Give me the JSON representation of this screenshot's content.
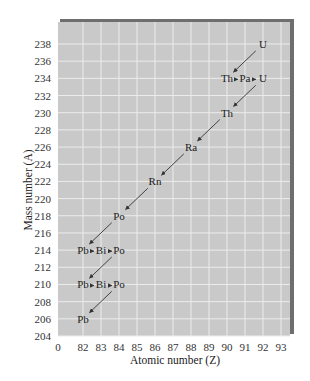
{
  "chart_data": {
    "type": "scatter",
    "title": "",
    "xlabel": "Atomic number (Z)",
    "ylabel": "Mass number (A)",
    "x_ticks": [
      "0",
      "82",
      "83",
      "84",
      "85",
      "86",
      "87",
      "88",
      "89",
      "90",
      "91",
      "92",
      "93"
    ],
    "y_ticks": [
      "238",
      "236",
      "234",
      "232",
      "230",
      "228",
      "226",
      "224",
      "222",
      "220",
      "218",
      "216",
      "214",
      "212",
      "210",
      "208",
      "206",
      "204"
    ],
    "xlim": [
      81,
      93.5
    ],
    "ylim": [
      204,
      240
    ],
    "grid": true,
    "nuclides": [
      {
        "symbol": "U",
        "Z": 92,
        "A": 238
      },
      {
        "symbol": "Th",
        "Z": 90,
        "A": 234
      },
      {
        "symbol": "Pa",
        "Z": 91,
        "A": 234
      },
      {
        "symbol": "U",
        "Z": 92,
        "A": 234
      },
      {
        "symbol": "Th",
        "Z": 90,
        "A": 230
      },
      {
        "symbol": "Ra",
        "Z": 88,
        "A": 226
      },
      {
        "symbol": "Rn",
        "Z": 86,
        "A": 222
      },
      {
        "symbol": "Po",
        "Z": 84,
        "A": 218
      },
      {
        "symbol": "Pb",
        "Z": 82,
        "A": 214
      },
      {
        "symbol": "Bi",
        "Z": 83,
        "A": 214
      },
      {
        "symbol": "Po",
        "Z": 84,
        "A": 214
      },
      {
        "symbol": "Pb",
        "Z": 82,
        "A": 210
      },
      {
        "symbol": "Bi",
        "Z": 83,
        "A": 210
      },
      {
        "symbol": "Po",
        "Z": 84,
        "A": 210
      },
      {
        "symbol": "Pb",
        "Z": 82,
        "A": 206
      }
    ],
    "alpha_decays": [
      {
        "from": [
          92,
          238
        ],
        "to": [
          90,
          234
        ]
      },
      {
        "from": [
          92,
          234
        ],
        "to": [
          90,
          230
        ]
      },
      {
        "from": [
          90,
          230
        ],
        "to": [
          88,
          226
        ]
      },
      {
        "from": [
          88,
          226
        ],
        "to": [
          86,
          222
        ]
      },
      {
        "from": [
          86,
          222
        ],
        "to": [
          84,
          218
        ]
      },
      {
        "from": [
          84,
          218
        ],
        "to": [
          82,
          214
        ]
      },
      {
        "from": [
          84,
          214
        ],
        "to": [
          82,
          210
        ]
      },
      {
        "from": [
          84,
          210
        ],
        "to": [
          82,
          206
        ]
      }
    ],
    "beta_decays": [
      {
        "from": [
          90,
          234
        ],
        "to": [
          91,
          234
        ]
      },
      {
        "from": [
          91,
          234
        ],
        "to": [
          92,
          234
        ]
      },
      {
        "from": [
          82,
          214
        ],
        "to": [
          83,
          214
        ]
      },
      {
        "from": [
          83,
          214
        ],
        "to": [
          84,
          214
        ]
      },
      {
        "from": [
          82,
          210
        ],
        "to": [
          83,
          210
        ]
      },
      {
        "from": [
          83,
          210
        ],
        "to": [
          84,
          210
        ]
      }
    ]
  },
  "colors": {
    "plot_bg": "#c9c9c9",
    "grid": "#ececec",
    "shadow": "#6e6e6e",
    "arrow": "#333333",
    "text": "#222222"
  }
}
